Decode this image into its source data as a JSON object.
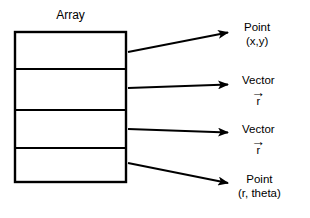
{
  "diagram": {
    "title": "Array",
    "array": {
      "label": "Array",
      "cell_count": 4,
      "cells": [
        {
          "index": 0,
          "name": "array-cell-1"
        },
        {
          "index": 1,
          "name": "array-cell-2"
        },
        {
          "index": 2,
          "name": "array-cell-3"
        },
        {
          "index": 3,
          "name": "array-cell-4"
        }
      ],
      "box": {
        "x": 14,
        "y": 31,
        "width": 113,
        "height": 152
      },
      "dividers_y": [
        69,
        110,
        148
      ],
      "stroke_color": "#000000",
      "fill_color": "#ffffff",
      "stroke_width": 2
    },
    "arrows": [
      {
        "name": "arrow-to-point-xy",
        "x1": 128,
        "y1": 52,
        "x2": 234,
        "y2": 31
      },
      {
        "name": "arrow-to-vector-r-1",
        "x1": 128,
        "y1": 88,
        "x2": 234,
        "y2": 84
      },
      {
        "name": "arrow-to-vector-r-2",
        "x1": 128,
        "y1": 129,
        "x2": 234,
        "y2": 133
      },
      {
        "name": "arrow-to-point-r-theta",
        "x1": 128,
        "y1": 163,
        "x2": 234,
        "y2": 184
      }
    ],
    "labels": [
      {
        "name": "label-point-xy",
        "kind": "point",
        "line1": "Point",
        "line2": "(x,y)",
        "x": 244,
        "y": 20
      },
      {
        "name": "label-vector-r-1",
        "kind": "vector",
        "line1": "Vector",
        "vector_symbol": "→",
        "vector_base": "r",
        "x": 244,
        "y": 73
      },
      {
        "name": "label-vector-r-2",
        "kind": "vector",
        "line1": "Vector",
        "vector_symbol": "→",
        "vector_base": "r",
        "x": 244,
        "y": 122
      },
      {
        "name": "label-point-r-theta",
        "kind": "point",
        "line1": "Point",
        "line2": "(r, theta)",
        "x": 238,
        "y": 172
      }
    ],
    "colors": {
      "ink": "#000000",
      "background": "#ffffff"
    }
  }
}
